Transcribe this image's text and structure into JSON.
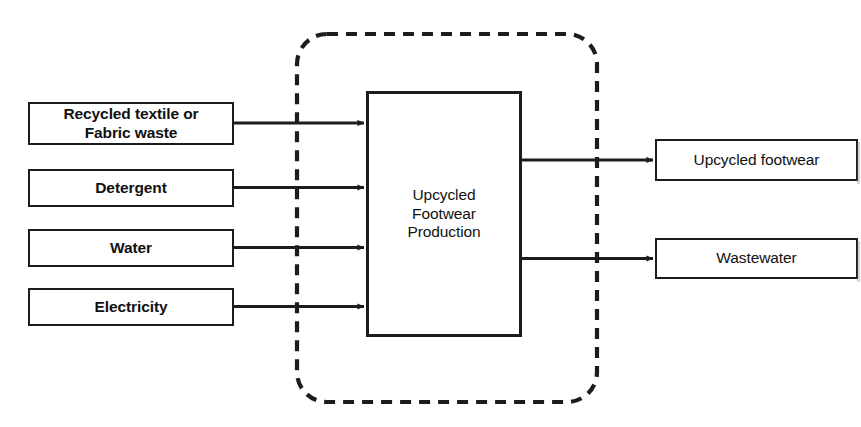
{
  "diagram": {
    "type": "process-flow-block-diagram",
    "colors": {
      "background": "#ffffff",
      "stroke": "#1c1c1c",
      "text": "#111111",
      "boundary_stroke": "#1c1c1c"
    },
    "system_boundary": {
      "name": "system-boundary",
      "style": "dashed rounded rectangle",
      "label": ""
    },
    "inputs": [
      {
        "id": "input-recycled-textile",
        "label": "Recycled textile or\nFabric waste"
      },
      {
        "id": "input-detergent",
        "label": "Detergent"
      },
      {
        "id": "input-water",
        "label": "Water"
      },
      {
        "id": "input-electricity",
        "label": "Electricity"
      }
    ],
    "process": {
      "id": "process-upcycled-footwear-production",
      "label": "Upcycled\nFootwear\nProduction"
    },
    "outputs": [
      {
        "id": "output-upcycled-footwear",
        "label": "Upcycled footwear"
      },
      {
        "id": "output-wastewater",
        "label": "Wastewater"
      }
    ]
  }
}
